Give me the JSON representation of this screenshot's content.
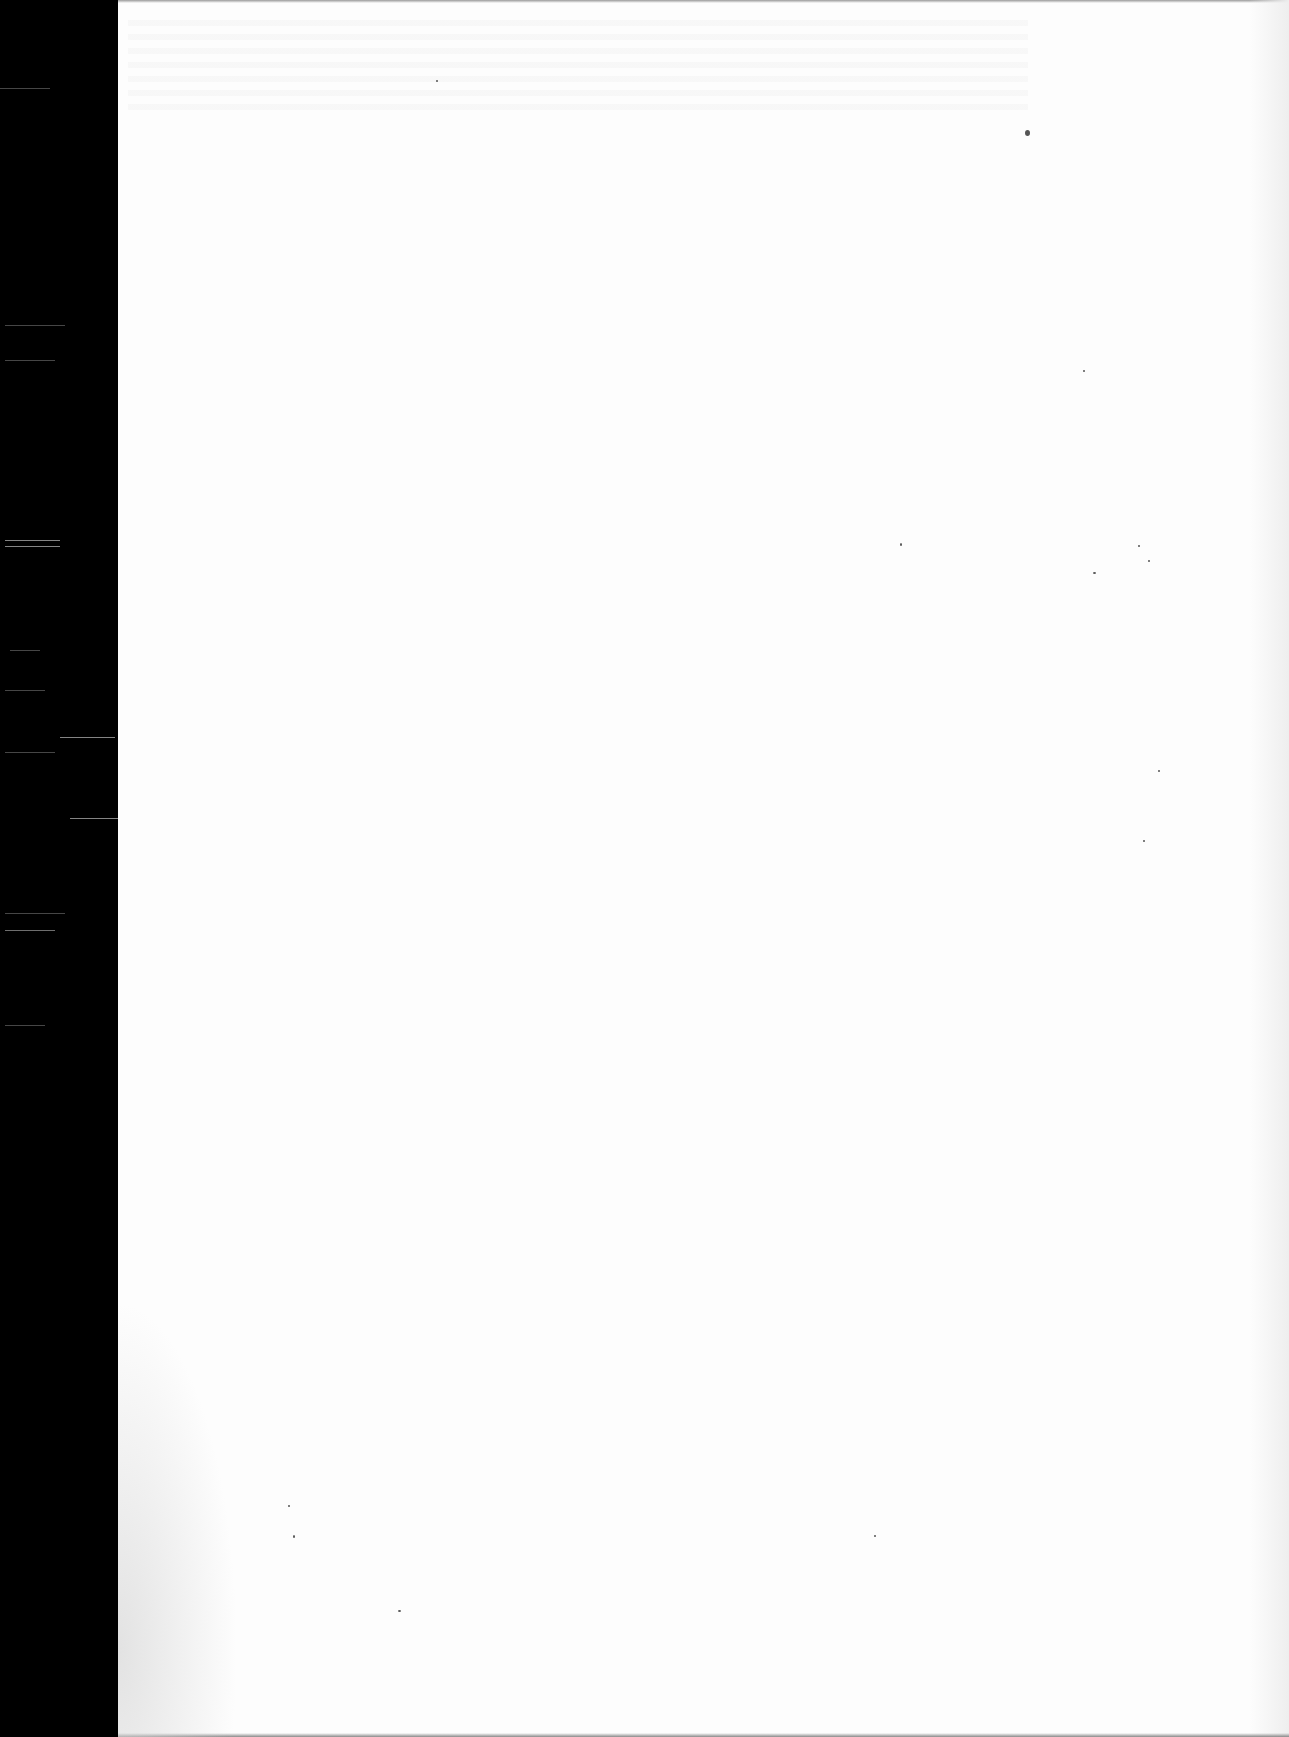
{
  "document": {
    "type": "scanned-page",
    "content_state": "blank",
    "visible_text": "",
    "colors": {
      "scanner_bed": "#000000",
      "paper": "#fdfdfd",
      "specks": "#555555"
    }
  }
}
